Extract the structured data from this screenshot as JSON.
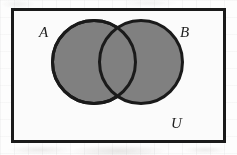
{
  "figure": {
    "kind": "venn-diagram",
    "width": 237,
    "height": 155,
    "background_color": "#fdfdfd"
  },
  "universe": {
    "label": "U",
    "shape": "rectangle",
    "x": 11,
    "y": 8,
    "width": 215,
    "height": 135,
    "stroke_color": "#1a1a1a",
    "stroke_width": 3,
    "fill_color": "#fbfbfb"
  },
  "sets": [
    {
      "label": "A",
      "shape": "circle",
      "cx": 94,
      "cy": 62,
      "r": 43,
      "fill_color": "#808080",
      "stroke_color": "#1a1a1a",
      "stroke_width": 3
    },
    {
      "label": "B",
      "shape": "circle",
      "cx": 141,
      "cy": 62,
      "r": 43,
      "fill_color": "#808080",
      "stroke_color": "#1a1a1a",
      "stroke_width": 3
    }
  ],
  "shading": {
    "description": "both circles fully shaded gray, including the overlap",
    "shaded_regions": [
      "A",
      "B",
      "A and B"
    ],
    "unshaded_regions": [
      "U outside A and B"
    ],
    "shade_color": "#808080"
  },
  "labels": {
    "set_a": "A",
    "set_b": "B",
    "universe": "U"
  }
}
